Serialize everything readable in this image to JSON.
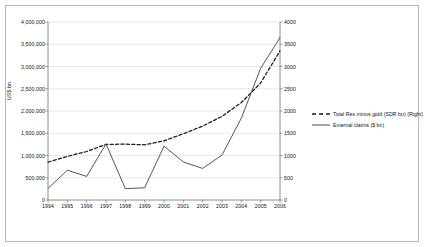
{
  "chart_data": {
    "type": "line",
    "title": "",
    "subtitle": "",
    "xlabel": "",
    "ylabel": "US$ bn",
    "ylabel_right": "",
    "grid": true,
    "legend_position": "right",
    "x": [
      "1994",
      "1995",
      "1996",
      "1997",
      "1998",
      "1999",
      "2000",
      "2001",
      "2002",
      "2003",
      "2004",
      "2005",
      "2006"
    ],
    "xtick_labels": [
      "1994",
      "1995",
      "1996",
      "1997",
      "1998",
      "1999",
      "2000",
      "2001",
      "2002",
      "2003",
      "2004",
      "2005",
      "2006"
    ],
    "ylim": [
      0,
      4000000
    ],
    "ytick_labels": [
      "0",
      "500,000",
      "1,000,000",
      "1,500,000",
      "2,000,000",
      "2,500,000",
      "3,000,000",
      "3,500,000",
      "4,000,000"
    ],
    "ytick_values": [
      0,
      500000,
      1000000,
      1500000,
      2000000,
      2500000,
      3000000,
      3500000,
      4000000
    ],
    "ylim_right": [
      0,
      4000
    ],
    "ytick_labels_right": [
      "0",
      "500",
      "1000",
      "1500",
      "2000",
      "2500",
      "3000",
      "3500",
      "4000"
    ],
    "ytick_values_right": [
      0,
      500,
      1000,
      1500,
      2000,
      2500,
      3000,
      3500,
      4000
    ],
    "series": [
      {
        "name": "Total Res minus gold (SDR bn) (Right)",
        "axis": "right",
        "style": "dashed",
        "color": "#1a1a1a",
        "values": [
          850,
          980,
          1090,
          1250,
          1255,
          1240,
          1330,
          1490,
          1660,
          1880,
          2190,
          2630,
          3350
        ]
      },
      {
        "name": "External claims ($ bn)",
        "axis": "left",
        "style": "solid",
        "color": "#4d4d4d",
        "values": [
          260000,
          670000,
          530000,
          1260000,
          255000,
          275000,
          1210000,
          855000,
          710000,
          1010000,
          1840000,
          2960000,
          3650000
        ]
      }
    ],
    "legend": [
      {
        "label": "Total Res minus gold (SDR bn) (Right)",
        "style": "dashed",
        "color": "#1a1a1a"
      },
      {
        "label": "External claims ($ bn)",
        "style": "solid",
        "color": "#4d4d4d"
      }
    ],
    "colors": {
      "axis": "#808080",
      "grid": "#d9d9d9",
      "frame": "#b7b7b7",
      "text": "#111111",
      "background": "#ffffff"
    }
  }
}
